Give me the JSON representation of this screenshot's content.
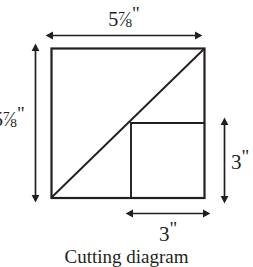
{
  "figure": {
    "caption": "Cutting diagram",
    "background_color": "#ffffff",
    "line_color": "#231f20"
  },
  "dimensions": {
    "top": {
      "whole": "5",
      "numerator": "7",
      "slash": "⁄",
      "denominator": "8",
      "unit": "\"",
      "full_text": "5 7/8\"",
      "icon": "double-arrow-horizontal-icon"
    },
    "left": {
      "whole": "5",
      "numerator": "7",
      "slash": "⁄",
      "denominator": "8",
      "unit": "\"",
      "full_text": "5 7/8\"",
      "icon": "double-arrow-vertical-icon"
    },
    "right": {
      "value": "3",
      "unit": "\"",
      "full_text": "3\"",
      "icon": "double-arrow-vertical-icon"
    },
    "bottom": {
      "value": "3",
      "unit": "\"",
      "full_text": "3\"",
      "icon": "double-arrow-horizontal-icon"
    }
  },
  "shapes": {
    "outer_square_label": "outer-square",
    "inner_square_label": "inner-square",
    "diagonal_label": "diagonal-cut-line"
  }
}
